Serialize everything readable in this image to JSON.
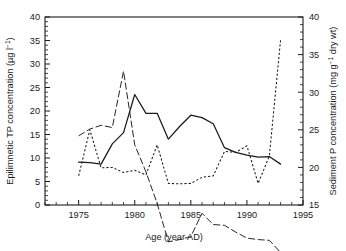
{
  "chart_data": {
    "type": "line",
    "title": "",
    "xlabel": "Age (year AD)",
    "ylabel": "Epilimnetic TP concentration (µg l",
    "ylabel_sup": "−1",
    "ylabel_tail": ")",
    "y2label_a": "Sediment P concentration (mg g",
    "y2label_sup": "−1",
    "y2label_tail": " dry wt)",
    "xlim": [
      1972,
      1995
    ],
    "ylim": [
      0,
      40
    ],
    "y2lim": [
      15,
      40
    ],
    "grid": false,
    "legend": "none",
    "xticks": [
      1975,
      1980,
      1985,
      1990,
      1995
    ],
    "xtick_labels": [
      "1975",
      "1980",
      "1985",
      "1990",
      "1995"
    ],
    "xminor_step": 1,
    "yticks": [
      0,
      5,
      10,
      15,
      20,
      25,
      30,
      35,
      40
    ],
    "ytick_labels": [
      "0",
      "5",
      "10",
      "15",
      "20",
      "25",
      "30",
      "35",
      "40"
    ],
    "yminor_step": 1,
    "y2ticks": [
      15,
      20,
      25,
      30,
      35,
      40
    ],
    "y2tick_labels": [
      "15",
      "20",
      "25",
      "30",
      "35",
      "40"
    ],
    "series": [
      {
        "name": "Epilimnetic TP concentration",
        "style": "solid",
        "axis": "left",
        "x": [
          1975,
          1976,
          1977,
          1978,
          1979,
          1980,
          1981,
          1982,
          1983,
          1984,
          1985,
          1986,
          1987,
          1988,
          1989,
          1990,
          1991,
          1992,
          1993
        ],
        "values": [
          9.1,
          9.0,
          8.7,
          13.0,
          15.4,
          23.5,
          19.5,
          19.5,
          14.0,
          16.7,
          19.1,
          18.6,
          17.3,
          12.2,
          11.2,
          10.6,
          10.2,
          10.3,
          8.7
        ]
      },
      {
        "name": "Sediment P concentration",
        "style": "long-dash",
        "axis": "right",
        "x": [
          1975,
          1976,
          1977,
          1978,
          1979,
          1980,
          1981,
          1982,
          1983,
          1984,
          1985,
          1986,
          1987,
          1988,
          1989,
          1990,
          1991,
          1992,
          1993
        ],
        "values": [
          24.2,
          25.1,
          25.6,
          25.3,
          32.8,
          23.0,
          19.4,
          15.2,
          10.1,
          10.4,
          10.8,
          13.9,
          12.4,
          12.3,
          11.4,
          10.6,
          10.4,
          10.3,
          8.7
        ]
      },
      {
        "name": "Sediment P record",
        "style": "dotted",
        "axis": "left",
        "x": [
          1975,
          1976,
          1977,
          1978,
          1979,
          1980,
          1981,
          1982,
          1983,
          1984,
          1985,
          1986,
          1987,
          1988,
          1989,
          1990,
          1991,
          1992,
          1993
        ],
        "values": [
          6.2,
          16.0,
          7.9,
          8.0,
          6.9,
          7.4,
          6.4,
          12.8,
          4.6,
          4.5,
          4.6,
          5.9,
          6.2,
          11.4,
          11.2,
          12.6,
          4.6,
          10.4,
          35.1
        ]
      }
    ]
  }
}
